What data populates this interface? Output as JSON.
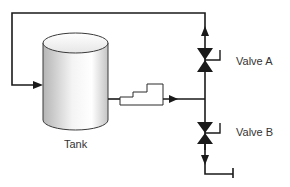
{
  "diagram": {
    "tank": {
      "label": "Tank"
    },
    "valve_a": {
      "label": "Valve A"
    },
    "valve_b": {
      "label": "Valve B"
    },
    "colors": {
      "line": "#1a1a1a",
      "tank_light": "#ffffff",
      "tank_dark": "#b8b8b8",
      "text": "#333333"
    }
  }
}
